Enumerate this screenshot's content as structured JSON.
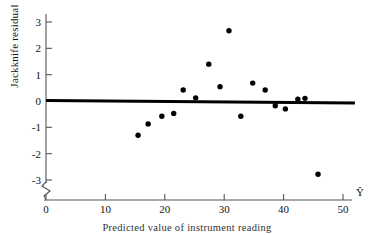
{
  "figure": {
    "caption": "Predicted value of instrument reading",
    "ylabel": "Jackknife residual",
    "xlabel_symbol": "Ŷ",
    "axis_break_symbol": "zigzag-break"
  },
  "chart_data": {
    "type": "scatter",
    "title": "",
    "xlabel": "Predicted value of instrument reading",
    "ylabel": "Jackknife residual",
    "x_axis_symbol": "Ŷ",
    "xlim": [
      0,
      51
    ],
    "ylim": [
      -3.35,
      3.35
    ],
    "xticks": [
      0,
      10,
      20,
      30,
      40,
      50
    ],
    "xtick_labels": [
      "0",
      "10",
      "20",
      "30",
      "40",
      "50"
    ],
    "yticks": [
      -3,
      -2,
      -1,
      0,
      1,
      2,
      3
    ],
    "ytick_labels": [
      "-3",
      "-2",
      "-1",
      "0",
      "1",
      "2",
      "3"
    ],
    "grid": false,
    "legend": null,
    "marker": "filled-circle",
    "marker_color": "#000000",
    "reference_line": {
      "label": "zero residual line",
      "y": 0,
      "x_start": 0,
      "x_end": 52,
      "color": "#000000",
      "width": 3
    },
    "points": [
      {
        "x": 15.5,
        "y": -1.3
      },
      {
        "x": 17.2,
        "y": -0.87
      },
      {
        "x": 19.5,
        "y": -0.58
      },
      {
        "x": 21.5,
        "y": -0.47
      },
      {
        "x": 23.1,
        "y": 0.42
      },
      {
        "x": 25.2,
        "y": 0.12
      },
      {
        "x": 27.4,
        "y": 1.4
      },
      {
        "x": 29.3,
        "y": 0.54
      },
      {
        "x": 30.8,
        "y": 2.67
      },
      {
        "x": 32.8,
        "y": -0.58
      },
      {
        "x": 34.8,
        "y": 0.68
      },
      {
        "x": 36.9,
        "y": 0.42
      },
      {
        "x": 38.6,
        "y": -0.18
      },
      {
        "x": 40.3,
        "y": -0.3
      },
      {
        "x": 42.4,
        "y": 0.07
      },
      {
        "x": 43.6,
        "y": 0.1
      },
      {
        "x": 45.8,
        "y": -2.78
      }
    ]
  }
}
